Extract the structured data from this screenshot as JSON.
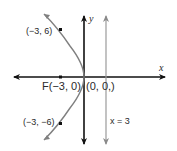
{
  "diagram": {
    "type": "parabola-graph",
    "equation_hint": "y^2 = -12x",
    "axes": {
      "x_label": "x",
      "y_label": "y",
      "origin_label": "(0, 0,)"
    },
    "focus": {
      "label": "F(−3, 0)",
      "x": -3,
      "y": 0
    },
    "points": [
      {
        "label": "(−3, 6)",
        "x": -3,
        "y": 6
      },
      {
        "label": "(−3, −6)",
        "x": -3,
        "y": -6
      }
    ],
    "directrix": {
      "label": "x = 3",
      "x": 3
    },
    "colors": {
      "axes": "#111111",
      "curve": "#808080",
      "directrix": "#9a9a9a",
      "text": "#2a2a2a"
    }
  }
}
